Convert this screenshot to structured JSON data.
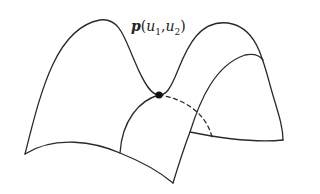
{
  "diagram": {
    "point_label": {
      "symbol": "p",
      "open": "(",
      "u1": "u",
      "u1_sub": "1",
      "comma": ",",
      "u2": "u",
      "u2_sub": "2",
      "close": ")"
    },
    "colors": {
      "stroke": "#2a2a2a",
      "point": "#111111",
      "background": "#ffffff"
    },
    "point": {
      "x": 159,
      "y": 95,
      "r": 3.6
    }
  }
}
